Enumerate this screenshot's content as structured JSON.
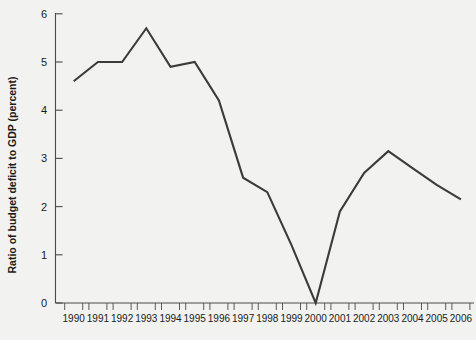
{
  "chart_data": {
    "type": "line",
    "title": "",
    "xlabel": "",
    "ylabel": "Ratio of budget deficit to GDP (percent)",
    "categories": [
      "1990",
      "1991",
      "1992",
      "1993",
      "1994",
      "1995",
      "1996",
      "1997",
      "1998",
      "1999",
      "2000",
      "2001",
      "2002",
      "2003",
      "2004",
      "2005",
      "2006"
    ],
    "values": [
      4.6,
      5.0,
      5.0,
      5.7,
      4.9,
      5.0,
      4.2,
      2.6,
      2.3,
      1.2,
      0.0,
      1.9,
      2.7,
      3.15,
      2.8,
      2.45,
      2.15
    ],
    "series": [
      {
        "name": "Ratio of budget deficit to GDP",
        "values": [
          4.6,
          5.0,
          5.0,
          5.7,
          4.9,
          5.0,
          4.2,
          2.6,
          2.3,
          1.2,
          0.0,
          1.9,
          2.7,
          3.15,
          2.8,
          2.45,
          2.15
        ]
      }
    ],
    "ylim": [
      0,
      6
    ],
    "yticks": [
      0,
      1,
      2,
      3,
      4,
      5,
      6
    ],
    "ytick_labels": [
      "0",
      "1",
      "2",
      "3",
      "4",
      "5",
      "6"
    ],
    "xtick_labels": [
      "1990",
      "1991",
      "1992",
      "1993",
      "1994",
      "1995",
      "1996",
      "1997",
      "1998",
      "1999",
      "2000",
      "2001",
      "2002",
      "2003",
      "2004",
      "2005",
      "2006"
    ],
    "grid": false,
    "legend": false,
    "legend_position": "none",
    "line_color": "#3b3b3b",
    "background_color": "#f2f2f0",
    "axis_color": "#4a4a4a"
  }
}
